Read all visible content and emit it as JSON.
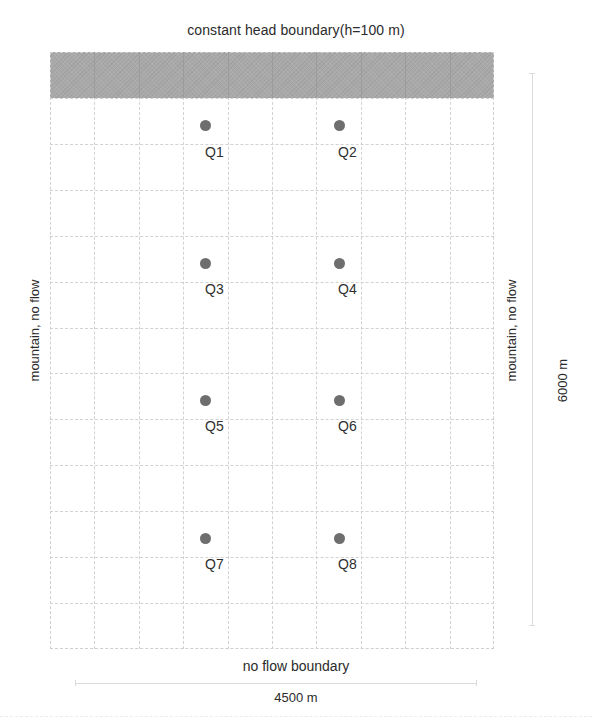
{
  "diagram": {
    "title": "constant head boundary(h=100 m)",
    "bottom_boundary": "no flow boundary",
    "left_boundary": "mountain, no flow",
    "right_boundary": "mountain, no flow",
    "width_dimension": "4500 m",
    "height_dimension": "6000 m",
    "grid": {
      "columns": 10,
      "rows": 13,
      "shaded_top_rows": 1,
      "shade_color": "#a9a9a9",
      "line_color": "#d2d2d2"
    },
    "wells": [
      {
        "label": "Q1",
        "col": 3.5,
        "row": 1.5
      },
      {
        "label": "Q2",
        "col": 6.5,
        "row": 1.5
      },
      {
        "label": "Q3",
        "col": 3.5,
        "row": 4.5
      },
      {
        "label": "Q4",
        "col": 6.5,
        "row": 4.5
      },
      {
        "label": "Q5",
        "col": 3.5,
        "row": 7.5
      },
      {
        "label": "Q6",
        "col": 6.5,
        "row": 7.5
      },
      {
        "label": "Q7",
        "col": 3.5,
        "row": 10.5
      },
      {
        "label": "Q8",
        "col": 6.5,
        "row": 10.5
      }
    ],
    "well_color": "#6e6e6e"
  }
}
